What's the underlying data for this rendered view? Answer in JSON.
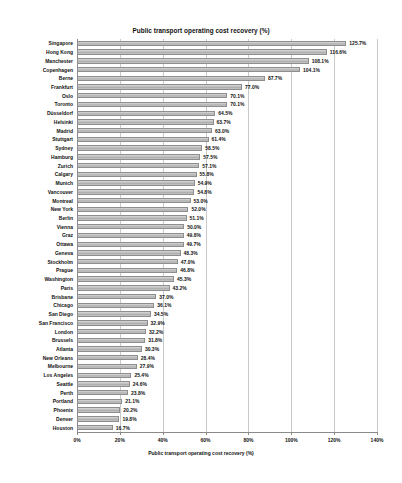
{
  "chart_data": {
    "type": "bar",
    "orientation": "horizontal",
    "title": "Public transport operating cost recovery (%)",
    "xlabel": "Public transport operating cost recovery (%)",
    "ylabel": "",
    "xlim": [
      0,
      140
    ],
    "xticks": [
      0,
      20,
      40,
      60,
      80,
      100,
      120,
      140
    ],
    "xtick_labels": [
      "0%",
      "20%",
      "40%",
      "60%",
      "80%",
      "100%",
      "120%",
      "140%"
    ],
    "grid": true,
    "legend": null,
    "bar_color": "#bdbdbd",
    "bar_edge_color": "#8e8e8e",
    "value_suffix": "%",
    "categories": [
      "Singapore",
      "Hong Kong",
      "Manchester",
      "Copenhagen",
      "Berne",
      "Frankfurt",
      "Oslo",
      "Toronto",
      "Düsseldorf",
      "Helsinki",
      "Madrid",
      "Stuttgart",
      "Sydney",
      "Hamburg",
      "Zurich",
      "Calgary",
      "Munich",
      "Vancouver",
      "Montreal",
      "New York",
      "Berlin",
      "Vienna",
      "Graz",
      "Ottawa",
      "Geneva",
      "Stockholm",
      "Prague",
      "Washington",
      "Paris",
      "Brisbane",
      "Chicago",
      "San Diego",
      "San Francisco",
      "London",
      "Brussels",
      "Atlanta",
      "New Orleans",
      "Melbourne",
      "Los Angeles",
      "Seattle",
      "Perth",
      "Portland",
      "Phoenix",
      "Denver",
      "Houston"
    ],
    "values": [
      125.7,
      116.6,
      108.1,
      104.1,
      87.7,
      77.0,
      70.1,
      70.1,
      64.5,
      63.7,
      63.0,
      61.4,
      58.5,
      57.5,
      57.1,
      55.8,
      54.9,
      54.8,
      53.0,
      52.0,
      51.1,
      50.0,
      49.8,
      49.7,
      48.3,
      47.0,
      46.8,
      45.3,
      43.2,
      37.0,
      36.1,
      34.5,
      32.9,
      32.2,
      31.8,
      30.3,
      28.4,
      27.9,
      25.4,
      24.6,
      23.8,
      21.1,
      20.2,
      19.8,
      16.7
    ],
    "value_labels": [
      "125.7%",
      "116.6%",
      "108.1%",
      "104.1%",
      "87.7%",
      "77.0%",
      "70.1%",
      "70.1%",
      "64.5%",
      "63.7%",
      "63.0%",
      "61.4%",
      "58.5%",
      "57.5%",
      "57.1%",
      "55.8%",
      "54.9%",
      "54.8%",
      "53.0%",
      "52.0%",
      "51.1%",
      "50.0%",
      "49.8%",
      "49.7%",
      "48.3%",
      "47.0%",
      "46.8%",
      "45.3%",
      "43.2%",
      "37.0%",
      "36.1%",
      "34.5%",
      "32.9%",
      "32.2%",
      "31.8%",
      "30.3%",
      "28.4%",
      "27.9%",
      "25.4%",
      "24.6%",
      "23.8%",
      "21.1%",
      "20.2%",
      "19.8%",
      "16.7%"
    ]
  }
}
